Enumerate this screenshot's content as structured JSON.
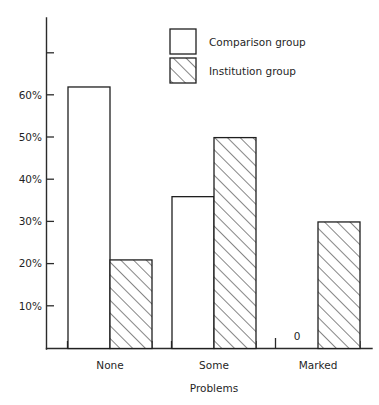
{
  "chart_data": {
    "type": "bar",
    "title": "",
    "subtitle": "",
    "xlabel": "Problems",
    "ylabel": "",
    "categories": [
      "None",
      "Some",
      "Marked"
    ],
    "series": [
      {
        "name": "Comparison group",
        "values": [
          62,
          36,
          0
        ],
        "style": "open"
      },
      {
        "name": "Institution group",
        "values": [
          21,
          50,
          30
        ],
        "style": "hatched"
      }
    ],
    "ytick_labels": [
      "10%",
      "20%",
      "30%",
      "40%",
      "50%",
      "60%"
    ],
    "ytick_values": [
      10,
      20,
      30,
      40,
      50,
      60
    ],
    "ylim": [
      0,
      72
    ],
    "grid": false,
    "legend_position": "top-center",
    "annotations": [
      {
        "text": "0",
        "category": "Marked",
        "series": "Comparison group",
        "value": 0
      }
    ]
  },
  "legend": {
    "entries": [
      {
        "label": "Comparison group",
        "swatch": "open-square-icon"
      },
      {
        "label": "Institution group",
        "swatch": "hatched-square-icon"
      }
    ]
  },
  "axes": {
    "x_title": "Problems",
    "x_categories": [
      "None",
      "Some",
      "Marked"
    ],
    "y_ticks": [
      "10%",
      "20%",
      "30%",
      "40%",
      "50%",
      "60%"
    ]
  },
  "colors": {
    "ink": "#1f1f1f",
    "axis": "#2b2b2b",
    "bar_open_fill": "#ffffff",
    "bar_hatch_fill": "#ffffff",
    "background": "#ffffff"
  }
}
